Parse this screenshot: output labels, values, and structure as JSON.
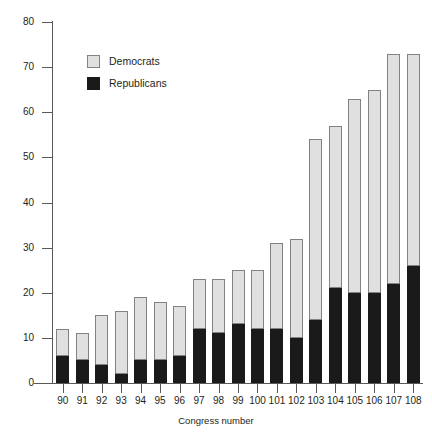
{
  "chart_data": {
    "type": "bar",
    "stacked": true,
    "title": "",
    "subtitle": "",
    "xlabel": "Congress number",
    "ylabel": "",
    "grid": false,
    "legend_position": "top-left",
    "ylim": [
      0,
      80
    ],
    "ytick_labels": [
      "0",
      "10",
      "20",
      "30",
      "40",
      "50",
      "60",
      "70",
      "80"
    ],
    "yticks": [
      0,
      10,
      20,
      30,
      40,
      50,
      60,
      70,
      80
    ],
    "categories": [
      "90",
      "91",
      "92",
      "93",
      "94",
      "95",
      "96",
      "97",
      "98",
      "99",
      "100",
      "101",
      "102",
      "103",
      "104",
      "105",
      "106",
      "107",
      "108"
    ],
    "series": [
      {
        "name": "Republicans",
        "color": "#1a1a1a",
        "values": [
          6,
          5,
          4,
          2,
          5,
          5,
          6,
          12,
          11,
          13,
          12,
          12,
          10,
          14,
          21,
          20,
          20,
          22,
          26
        ]
      },
      {
        "name": "Democrats",
        "color": "#e0e0e0",
        "values": [
          6,
          6,
          11,
          14,
          14,
          13,
          11,
          11,
          12,
          12,
          13,
          19,
          22,
          40,
          36,
          43,
          45,
          51,
          47
        ]
      }
    ],
    "totals": [
      12,
      11,
      15,
      16,
      19,
      18,
      17,
      23,
      23,
      25,
      25,
      31,
      32,
      54,
      57,
      63,
      65,
      73,
      73
    ]
  },
  "legend": {
    "items": [
      {
        "label": "Democrats",
        "swatch": "democrats-swatch"
      },
      {
        "label": "Republicans",
        "swatch": "republicans-swatch"
      }
    ]
  },
  "axis": {
    "x_title": "Congress number"
  }
}
